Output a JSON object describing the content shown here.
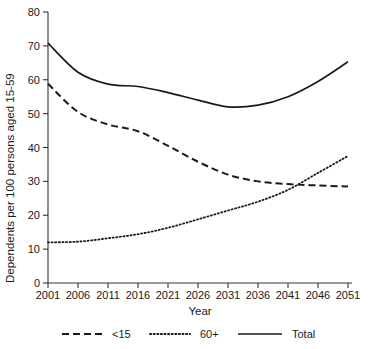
{
  "chart_data": {
    "type": "line",
    "title": "",
    "xlabel": "Year",
    "ylabel": "Dependents per 100 persons aged 15-59",
    "x": [
      2001,
      2006,
      2011,
      2016,
      2021,
      2026,
      2031,
      2036,
      2041,
      2046,
      2051
    ],
    "categories": [
      "2001",
      "2006",
      "2011",
      "2016",
      "2021",
      "2026",
      "2031",
      "2036",
      "2041",
      "2046",
      "2051"
    ],
    "xlim": [
      2001,
      2051
    ],
    "ylim": [
      0,
      80
    ],
    "yticks": [
      0,
      10,
      20,
      30,
      40,
      50,
      60,
      70,
      80
    ],
    "ytick_labels": [
      "0",
      "10",
      "20",
      "30",
      "40",
      "50",
      "60",
      "70",
      "80"
    ],
    "grid": false,
    "legend_position": "bottom",
    "series": [
      {
        "name": "<15",
        "style": "dashed",
        "color": "#1a1a1a",
        "values": [
          58.8,
          50.5,
          46.8,
          44.8,
          40.5,
          35.8,
          32.0,
          30.0,
          29.2,
          28.8,
          28.5
        ]
      },
      {
        "name": "60+",
        "style": "dotted",
        "color": "#1a1a1a",
        "values": [
          12.0,
          12.2,
          13.2,
          14.4,
          16.3,
          18.8,
          21.4,
          24.0,
          27.5,
          32.5,
          37.5
        ]
      },
      {
        "name": "Total",
        "style": "solid",
        "color": "#1a1a1a",
        "values": [
          70.8,
          62.2,
          58.7,
          58.0,
          56.2,
          54.0,
          52.0,
          52.5,
          55.0,
          59.5,
          65.3
        ]
      }
    ]
  },
  "legend": {
    "items": [
      {
        "label": "<15",
        "style": "dashed"
      },
      {
        "label": "60+",
        "style": "dotted"
      },
      {
        "label": "Total",
        "style": "solid"
      }
    ]
  },
  "axes": {
    "x_title": "Year",
    "y_title": "Dependents per 100 persons aged 15-59"
  }
}
